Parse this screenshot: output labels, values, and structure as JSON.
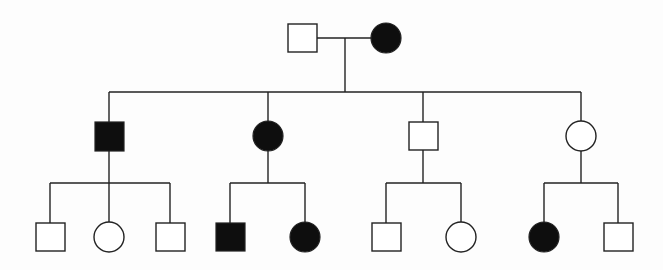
{
  "diagram": {
    "type": "pedigree-chart",
    "legend": {
      "square": "male",
      "circle": "female",
      "filled": "affected",
      "empty": "unaffected"
    },
    "colors": {
      "affected": "#0e0e0e",
      "unaffected": "#ffffff",
      "line": "#222222"
    },
    "generations": [
      {
        "label": "Generation I",
        "individuals": [
          {
            "id": "I-1",
            "sex": "male",
            "affected": false,
            "x": 302,
            "y": 38
          },
          {
            "id": "I-2",
            "sex": "female",
            "affected": true,
            "x": 386,
            "y": 38
          }
        ]
      },
      {
        "label": "Generation II",
        "individuals": [
          {
            "id": "II-1",
            "sex": "male",
            "affected": true,
            "x": 109,
            "y": 136
          },
          {
            "id": "II-2",
            "sex": "female",
            "affected": true,
            "x": 268,
            "y": 136
          },
          {
            "id": "II-3",
            "sex": "male",
            "affected": false,
            "x": 423,
            "y": 136
          },
          {
            "id": "II-4",
            "sex": "female",
            "affected": false,
            "x": 581,
            "y": 136
          }
        ]
      },
      {
        "label": "Generation III",
        "individuals": [
          {
            "id": "III-1",
            "sex": "male",
            "affected": false,
            "x": 50,
            "y": 237,
            "parent": "II-1"
          },
          {
            "id": "III-2",
            "sex": "female",
            "affected": false,
            "x": 109,
            "y": 237,
            "parent": "II-1"
          },
          {
            "id": "III-3",
            "sex": "male",
            "affected": false,
            "x": 170,
            "y": 237,
            "parent": "II-1"
          },
          {
            "id": "III-4",
            "sex": "male",
            "affected": true,
            "x": 230,
            "y": 237,
            "parent": "II-2"
          },
          {
            "id": "III-5",
            "sex": "female",
            "affected": true,
            "x": 305,
            "y": 237,
            "parent": "II-2"
          },
          {
            "id": "III-6",
            "sex": "male",
            "affected": false,
            "x": 386,
            "y": 237,
            "parent": "II-3"
          },
          {
            "id": "III-7",
            "sex": "female",
            "affected": false,
            "x": 461,
            "y": 237,
            "parent": "II-3"
          },
          {
            "id": "III-8",
            "sex": "female",
            "affected": true,
            "x": 544,
            "y": 237,
            "parent": "II-4"
          },
          {
            "id": "III-9",
            "sex": "male",
            "affected": false,
            "x": 618,
            "y": 237,
            "parent": "II-4"
          }
        ]
      }
    ]
  }
}
